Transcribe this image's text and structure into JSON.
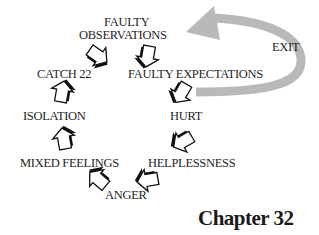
{
  "diagram": {
    "type": "cycle",
    "nodes": [
      {
        "id": "faulty-observations",
        "label_line1": "FAULTY",
        "label_line2": "OBSERVATIONS"
      },
      {
        "id": "faulty-expectations",
        "label": "FAULTY EXPECTATIONS"
      },
      {
        "id": "hurt",
        "label": "HURT"
      },
      {
        "id": "helplessness",
        "label": "HELPLESSNESS"
      },
      {
        "id": "anger",
        "label": "ANGER"
      },
      {
        "id": "mixed-feelings",
        "label": "MIXED FEELINGS"
      },
      {
        "id": "isolation",
        "label": "ISOLATION"
      },
      {
        "id": "catch-22",
        "label": "CATCH 22"
      }
    ],
    "edges": [
      {
        "from": "faulty-observations",
        "to": "faulty-expectations"
      },
      {
        "from": "faulty-expectations",
        "to": "hurt"
      },
      {
        "from": "hurt",
        "to": "helplessness"
      },
      {
        "from": "helplessness",
        "to": "anger"
      },
      {
        "from": "anger",
        "to": "mixed-feelings"
      },
      {
        "from": "mixed-feelings",
        "to": "isolation"
      },
      {
        "from": "isolation",
        "to": "catch-22"
      },
      {
        "from": "catch-22",
        "to": "faulty-observations"
      }
    ],
    "exit": {
      "label": "EXIT",
      "from": "faulty-expectations",
      "to": "faulty-observations",
      "color": "#b8b8b8"
    },
    "chapter": "Chapter 32"
  }
}
